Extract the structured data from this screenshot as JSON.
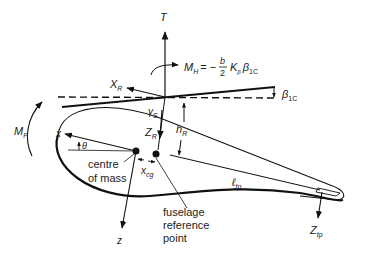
{
  "diagram": {
    "labels": {
      "thrust": "T",
      "hub_moment_M": "M",
      "hub_moment_sub": "H",
      "hub_moment_eq": "= −",
      "frac_num": "b",
      "frac_den": "2",
      "k_beta": "K",
      "k_beta_sub": "β",
      "beta": "β",
      "beta_sub": "1C",
      "beta_tip": "β",
      "beta_tip_sub": "1C",
      "x_r": "X",
      "x_r_sub": "R",
      "gamma": "γ",
      "gamma_sub": "S",
      "z_r": "Z",
      "z_r_sub": "R",
      "h_r": "h",
      "h_r_sub": "R",
      "m_f": "M",
      "m_f_sub": "F",
      "x_axis": "x",
      "theta": "θ",
      "centre_line1": "centre",
      "centre_line2": "of mass",
      "x_cg": "x",
      "x_cg_sub": "cg",
      "frp_line1": "fuselage",
      "frp_line2": "reference",
      "frp_line3": "point",
      "l_tp": "ℓ",
      "l_tp_sub": "tp",
      "z_axis": "z",
      "z_tp": "Z",
      "z_tp_sub": "tp"
    },
    "colors": {
      "ink": "#111111",
      "background": "#ffffff"
    }
  }
}
